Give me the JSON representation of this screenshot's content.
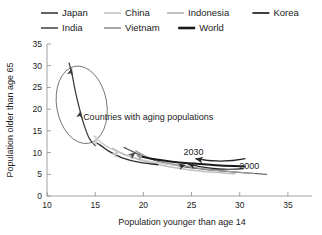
{
  "chart_data": {
    "type": "line",
    "title": "",
    "xlabel": "Population younger than age 14",
    "ylabel": "Population older than age 65",
    "xlim": [
      10,
      37.5
    ],
    "ylim": [
      0,
      35
    ],
    "xticks": [
      10,
      15,
      20,
      25,
      30,
      35
    ],
    "yticks": [
      0,
      5,
      10,
      15,
      20,
      25,
      30,
      35
    ],
    "grid": false,
    "legend_position": "top",
    "annotations": [
      {
        "text": "Countries with aging populations",
        "x": 20.5,
        "y": 17.5
      },
      {
        "text": "2030",
        "x": 25.2,
        "y": 9.5
      },
      {
        "text": "2000",
        "x": 31.0,
        "y": 6.2
      }
    ],
    "highlight_ellipse": {
      "cx": 13.6,
      "cy": 21.0,
      "rx": 2.6,
      "ry": 9.0
    },
    "series": [
      {
        "name": "Japan",
        "color": "#3a3a3a",
        "width": 1.25,
        "points": [
          [
            15.0,
            11.6
          ],
          [
            14.4,
            13.2
          ],
          [
            13.9,
            16.0
          ],
          [
            13.5,
            19.0
          ],
          [
            13.0,
            23.5
          ],
          [
            12.6,
            28.0
          ],
          [
            12.3,
            30.6
          ]
        ]
      },
      {
        "name": "India",
        "color": "#4a4a4a",
        "width": 1.15,
        "points": [
          [
            32.8,
            5.0
          ],
          [
            30.0,
            5.4
          ],
          [
            27.0,
            6.0
          ],
          [
            24.0,
            6.8
          ],
          [
            21.5,
            8.0
          ],
          [
            19.5,
            9.6
          ],
          [
            18.0,
            11.2
          ]
        ]
      },
      {
        "name": "China",
        "color": "#cfcfcf",
        "width": 1.6,
        "points": [
          [
            24.8,
            6.9
          ],
          [
            23.0,
            7.2
          ],
          [
            21.0,
            7.8
          ],
          [
            19.0,
            8.8
          ],
          [
            17.2,
            10.3
          ],
          [
            15.8,
            12.0
          ],
          [
            14.9,
            13.8
          ]
        ]
      },
      {
        "name": "Vietnam",
        "color": "#9a9a9a",
        "width": 1.3,
        "points": [
          [
            31.5,
            5.2
          ],
          [
            29.0,
            5.6
          ],
          [
            26.5,
            6.2
          ],
          [
            24.0,
            7.0
          ],
          [
            21.8,
            8.0
          ],
          [
            20.2,
            9.2
          ],
          [
            19.2,
            10.4
          ]
        ]
      },
      {
        "name": "Indonesia",
        "color": "#c0c0c0",
        "width": 1.5,
        "points": [
          [
            29.5,
            5.1
          ],
          [
            27.0,
            5.5
          ],
          [
            24.5,
            6.1
          ],
          [
            22.0,
            7.0
          ],
          [
            19.8,
            8.2
          ],
          [
            18.0,
            9.6
          ],
          [
            16.8,
            11.0
          ]
        ]
      },
      {
        "name": "Korea",
        "color": "#2b2b2b",
        "width": 1.35,
        "points": [
          [
            21.5,
            7.2
          ],
          [
            19.5,
            7.8
          ],
          [
            17.8,
            8.8
          ],
          [
            16.5,
            10.2
          ],
          [
            15.6,
            11.6
          ],
          [
            15.0,
            12.4
          ]
        ]
      },
      {
        "name": "World",
        "color": "#1a1a1a",
        "width": 2.0,
        "points": [
          [
            30.5,
            6.8
          ],
          [
            28.0,
            7.0
          ],
          [
            25.5,
            7.4
          ],
          [
            23.0,
            7.9
          ],
          [
            21.0,
            8.5
          ],
          [
            19.5,
            9.2
          ]
        ]
      }
    ],
    "arrow_markers": [
      {
        "series": "Japan",
        "x": 12.6,
        "y": 29.4,
        "angle": -72
      },
      {
        "series": "Japan",
        "x": 13.5,
        "y": 19.6,
        "angle": -78
      },
      {
        "series": "China",
        "x": 15.2,
        "y": 13.2,
        "angle": -62
      },
      {
        "series": "Indonesia",
        "x": 17.4,
        "y": 10.2,
        "angle": -40
      },
      {
        "series": "Vietnam",
        "x": 20.0,
        "y": 9.6,
        "angle": -32
      },
      {
        "series": "India",
        "x": 19.2,
        "y": 10.0,
        "angle": -36
      },
      {
        "series": "Korea",
        "x": 24.4,
        "y": 7.2,
        "angle": -16
      }
    ],
    "callouts": [
      {
        "label": "2030",
        "from": [
          30.6,
          8.6
        ],
        "to": [
          25.4,
          8.6
        ]
      },
      {
        "label": "2000",
        "from": [
          30.4,
          6.3
        ],
        "to": [
          24.6,
          7.4
        ]
      }
    ]
  },
  "legend": {
    "row1": [
      {
        "label": "Japan",
        "color": "#3a3a3a",
        "width": 1.6
      },
      {
        "label": "China",
        "color": "#cfcfcf",
        "width": 2.0
      },
      {
        "label": "Indonesia",
        "color": "#c0c0c0",
        "width": 2.0
      },
      {
        "label": "Korea",
        "color": "#2b2b2b",
        "width": 1.8
      }
    ],
    "row2": [
      {
        "label": "India",
        "color": "#4a4a4a",
        "width": 1.6
      },
      {
        "label": "Vietnam",
        "color": "#9a9a9a",
        "width": 1.8
      },
      {
        "label": "World",
        "color": "#1a1a1a",
        "width": 2.6
      }
    ]
  },
  "axis": {
    "x_title": "Population younger than age 14",
    "y_title": "Population older than age 65",
    "x_tick_labels": [
      "10",
      "15",
      "20",
      "25",
      "30",
      "35"
    ],
    "y_tick_labels": [
      "0",
      "5",
      "10",
      "15",
      "20",
      "25",
      "30",
      "35"
    ]
  }
}
